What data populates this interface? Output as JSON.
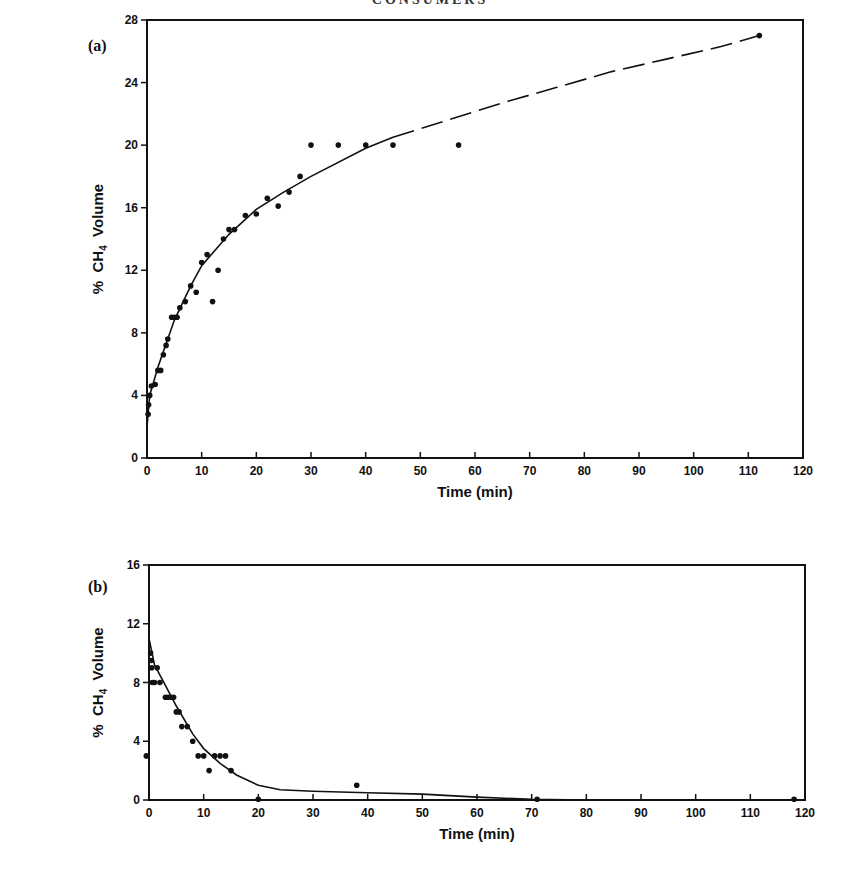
{
  "page": {
    "running_header": "CONSUMERS"
  },
  "panels": [
    {
      "label": "(a)",
      "x_title": "Time (min)",
      "y_title": "% CH4 Volume"
    },
    {
      "label": "(b)",
      "x_title": "Time (min)",
      "y_title": "% CH4 Volume"
    }
  ],
  "chart_data": [
    {
      "type": "scatter",
      "panel": "(a)",
      "title": "",
      "xlabel": "Time (min)",
      "ylabel": "% CH4 Volume",
      "xlim": [
        0,
        120
      ],
      "ylim": [
        0,
        28
      ],
      "xticks": [
        0,
        10,
        20,
        30,
        40,
        50,
        60,
        70,
        80,
        90,
        100,
        110,
        120
      ],
      "yticks": [
        0,
        4,
        8,
        12,
        16,
        20,
        24,
        28
      ],
      "grid": false,
      "series": [
        {
          "name": "measured",
          "marker": "dot",
          "points": [
            [
              0.2,
              2.8
            ],
            [
              0.3,
              3.4
            ],
            [
              0.5,
              4.0
            ],
            [
              0.8,
              4.6
            ],
            [
              1.5,
              4.7
            ],
            [
              2.0,
              5.6
            ],
            [
              2.5,
              5.6
            ],
            [
              3.0,
              6.6
            ],
            [
              3.5,
              7.2
            ],
            [
              3.8,
              7.6
            ],
            [
              4.5,
              9.0
            ],
            [
              5.0,
              9.0
            ],
            [
              5.5,
              9.0
            ],
            [
              6.0,
              9.6
            ],
            [
              7.0,
              10.0
            ],
            [
              8.0,
              11.0
            ],
            [
              9.0,
              10.6
            ],
            [
              10.0,
              12.5
            ],
            [
              11.0,
              13.0
            ],
            [
              12.0,
              10.0
            ],
            [
              13.0,
              12.0
            ],
            [
              14.0,
              14.0
            ],
            [
              15.0,
              14.6
            ],
            [
              16.0,
              14.6
            ],
            [
              18.0,
              15.5
            ],
            [
              20.0,
              15.6
            ],
            [
              22.0,
              16.6
            ],
            [
              24.0,
              16.1
            ],
            [
              26.0,
              17.0
            ],
            [
              28.0,
              18.0
            ],
            [
              30.0,
              20.0
            ],
            [
              35.0,
              20.0
            ],
            [
              40.0,
              20.0
            ],
            [
              45.0,
              20.0
            ],
            [
              57.0,
              20.0
            ],
            [
              112.0,
              27.0
            ]
          ]
        },
        {
          "name": "fit (solid)",
          "line": "solid",
          "points": [
            [
              0,
              2.0
            ],
            [
              0.5,
              4.0
            ],
            [
              2,
              5.8
            ],
            [
              5,
              8.8
            ],
            [
              8,
              11.0
            ],
            [
              10,
              12.3
            ],
            [
              15,
              14.3
            ],
            [
              20,
              15.9
            ],
            [
              25,
              17.0
            ],
            [
              30,
              18.0
            ],
            [
              40,
              19.8
            ],
            [
              45,
              20.5
            ]
          ]
        },
        {
          "name": "fit (dashed extrapolation)",
          "line": "dashed",
          "points": [
            [
              45,
              20.5
            ],
            [
              55,
              21.6
            ],
            [
              65,
              22.7
            ],
            [
              75,
              23.7
            ],
            [
              85,
              24.7
            ],
            [
              95,
              25.5
            ],
            [
              105,
              26.3
            ],
            [
              112,
              27.0
            ]
          ]
        }
      ]
    },
    {
      "type": "scatter",
      "panel": "(b)",
      "title": "",
      "xlabel": "Time (min)",
      "ylabel": "% CH4 Volume",
      "xlim": [
        0,
        120
      ],
      "ylim": [
        0,
        16
      ],
      "xticks": [
        0,
        10,
        20,
        30,
        40,
        50,
        60,
        70,
        80,
        90,
        100,
        110,
        120
      ],
      "yticks": [
        0,
        4,
        8,
        12,
        16
      ],
      "grid": false,
      "series": [
        {
          "name": "measured",
          "marker": "dot",
          "points": [
            [
              -0.5,
              3.0
            ],
            [
              0.3,
              10.0
            ],
            [
              0.4,
              9.5
            ],
            [
              0.5,
              9.0
            ],
            [
              0.6,
              8.0
            ],
            [
              1.0,
              8.0
            ],
            [
              1.5,
              9.0
            ],
            [
              2.0,
              8.0
            ],
            [
              3.0,
              7.0
            ],
            [
              3.5,
              7.0
            ],
            [
              4.0,
              7.0
            ],
            [
              4.5,
              7.0
            ],
            [
              5.0,
              6.0
            ],
            [
              5.5,
              6.0
            ],
            [
              6.0,
              5.0
            ],
            [
              7.0,
              5.0
            ],
            [
              8.0,
              4.0
            ],
            [
              9.0,
              3.0
            ],
            [
              10.0,
              3.0
            ],
            [
              11.0,
              2.0
            ],
            [
              12.0,
              3.0
            ],
            [
              13.0,
              3.0
            ],
            [
              14.0,
              3.0
            ],
            [
              15.0,
              2.0
            ],
            [
              20.0,
              0.05
            ],
            [
              38.0,
              1.0
            ],
            [
              71.0,
              0.05
            ],
            [
              118.0,
              0.05
            ]
          ]
        },
        {
          "name": "fit",
          "line": "solid",
          "points": [
            [
              0,
              11.0
            ],
            [
              1,
              9.2
            ],
            [
              3,
              7.8
            ],
            [
              5,
              6.4
            ],
            [
              8,
              4.5
            ],
            [
              10,
              3.5
            ],
            [
              13,
              2.5
            ],
            [
              16,
              1.7
            ],
            [
              20,
              1.0
            ],
            [
              24,
              0.7
            ],
            [
              30,
              0.6
            ],
            [
              40,
              0.5
            ],
            [
              50,
              0.4
            ],
            [
              60,
              0.2
            ],
            [
              70,
              0.05
            ],
            [
              80,
              0.0
            ],
            [
              120,
              0.0
            ]
          ]
        }
      ]
    }
  ]
}
